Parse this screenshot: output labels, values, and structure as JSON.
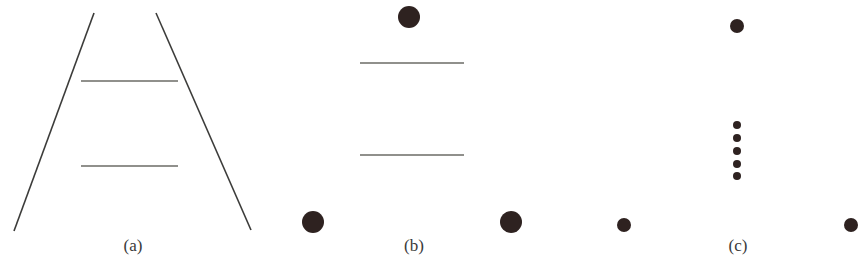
{
  "figure": {
    "panels": [
      {
        "label": "(a)",
        "name": "ponzo-converging-lines",
        "converging_lines": [
          {
            "x1": 94,
            "y1": 13,
            "x2": 14,
            "y2": 231
          },
          {
            "x1": 156,
            "y1": 13,
            "x2": 251,
            "y2": 230
          }
        ],
        "horizontal_lines": [
          {
            "x1": 81,
            "x2": 178,
            "y": 81
          },
          {
            "x1": 81,
            "x2": 178,
            "y": 166
          }
        ],
        "label_x": 133
      },
      {
        "label": "(b)",
        "name": "ponzo-large-dots",
        "dots": [
          {
            "cx": 409,
            "cy": 17,
            "r": 11
          },
          {
            "cx": 313,
            "cy": 222,
            "r": 11
          },
          {
            "cx": 511,
            "cy": 222,
            "r": 11
          }
        ],
        "horizontal_lines": [
          {
            "x1": 360,
            "x2": 464,
            "y": 63
          },
          {
            "x1": 360,
            "x2": 464,
            "y": 155
          }
        ],
        "label_x": 414
      },
      {
        "label": "(c)",
        "name": "dot-triangle-with-column",
        "dots": [
          {
            "cx": 737,
            "cy": 26,
            "r": 7
          },
          {
            "cx": 624,
            "cy": 225,
            "r": 7
          },
          {
            "cx": 851,
            "cy": 225,
            "r": 7
          }
        ],
        "small_dots": [
          {
            "cx": 737,
            "cy": 125,
            "r": 4
          },
          {
            "cx": 737,
            "cy": 138,
            "r": 4
          },
          {
            "cx": 737,
            "cy": 151,
            "r": 4
          },
          {
            "cx": 737,
            "cy": 164,
            "r": 4
          },
          {
            "cx": 737,
            "cy": 176,
            "r": 4
          }
        ],
        "label_x": 738
      }
    ],
    "colors": {
      "line": "#3c3c3a",
      "hline": "#6b6b66",
      "dot": "#2e2220"
    }
  }
}
